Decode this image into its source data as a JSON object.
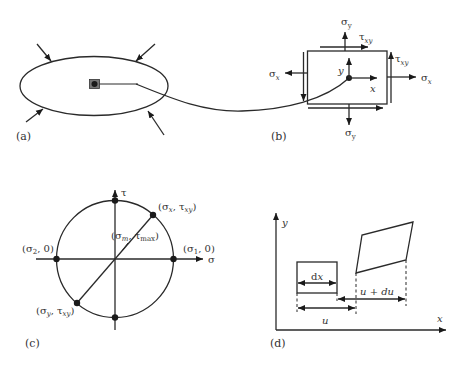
{
  "figure": {
    "panels": [
      {
        "id": "a",
        "label": "(a)",
        "description": "Elliptical body under compressive loads with material point"
      },
      {
        "id": "b",
        "label": "(b)",
        "stresses": {
          "sigma_y_top": {
            "main": "σ",
            "sub": "y"
          },
          "sigma_y_bottom": {
            "main": "σ",
            "sub": "y"
          },
          "sigma_x_left": {
            "main": "σ",
            "sub": "x"
          },
          "sigma_x_right": {
            "main": "σ",
            "sub": "x"
          },
          "tau_xy_top": {
            "main": "τ",
            "sub": "xy"
          },
          "tau_xy_right": {
            "main": "τ",
            "sub": "xy"
          }
        },
        "axis_x": "x",
        "axis_y": "y"
      },
      {
        "id": "c",
        "label": "(c)",
        "axis_tau": "τ",
        "axis_sigma": "σ",
        "points": {
          "sx_txy": {
            "open": "(",
            "s": "σ",
            "s_sub": "x",
            "sep": ", ",
            "t": "τ",
            "t_sub": "xy",
            "close": ")"
          },
          "sm_tmax": {
            "open": "(",
            "s": "σ",
            "s_sub": "m",
            "sep": ", ",
            "t": "τ",
            "t_sub": "max",
            "close": ")"
          },
          "s2_0": {
            "open": "(",
            "s": "σ",
            "s_sub": "2",
            "rest": ", 0)"
          },
          "s1_0": {
            "open": "(",
            "s": "σ",
            "s_sub": "1",
            "rest": ", 0)"
          },
          "sy_txy": {
            "open": "(",
            "s": "σ",
            "s_sub": "y",
            "sep": ", ",
            "t": "τ",
            "t_sub": "xy",
            "close": ")"
          }
        }
      },
      {
        "id": "d",
        "label": "(d)",
        "axis_x": "x",
        "axis_y": "y",
        "dim_dx": {
          "d": "d",
          "x": "x"
        },
        "dim_u": "u",
        "dim_u_du": {
          "u": "u",
          "plus": " + ",
          "du": "du"
        }
      }
    ]
  }
}
